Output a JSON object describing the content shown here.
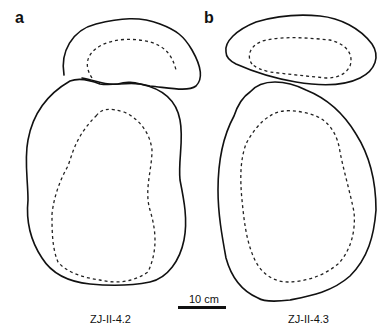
{
  "figure": {
    "panels": [
      {
        "id": "a",
        "label": "a",
        "specimen": "ZJ-II-4.2"
      },
      {
        "id": "b",
        "label": "b",
        "specimen": "ZJ-II-4.3"
      }
    ],
    "scale_bar": {
      "label": "10 cm",
      "length_cm": 10
    },
    "colors": {
      "line": "#111111",
      "background": "#ffffff"
    }
  }
}
